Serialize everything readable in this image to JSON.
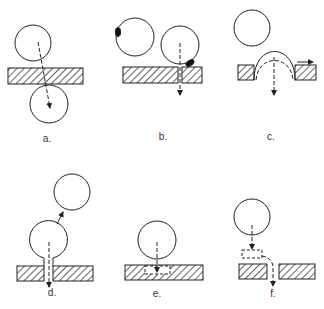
{
  "diagram": {
    "panels": [
      {
        "id": "a",
        "label": "a."
      },
      {
        "id": "b",
        "label": "b."
      },
      {
        "id": "c",
        "label": "c."
      },
      {
        "id": "d",
        "label": "d."
      },
      {
        "id": "e",
        "label": "e."
      },
      {
        "id": "f",
        "label": "f."
      }
    ],
    "colors": {
      "stroke": "#222222",
      "background": "#ffffff"
    }
  }
}
